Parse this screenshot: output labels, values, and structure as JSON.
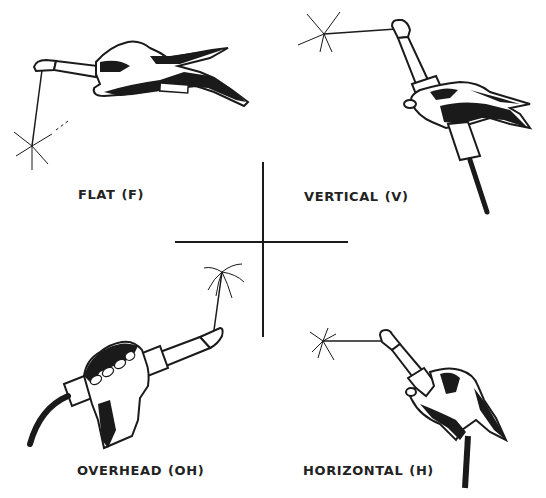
{
  "figure": {
    "positions": [
      {
        "id": "flat",
        "name": "FLAT",
        "code": "(F)"
      },
      {
        "id": "vertical",
        "name": "VERTICAL",
        "code": "(V)"
      },
      {
        "id": "overhead",
        "name": "OVERHEAD",
        "code": "(OH)"
      },
      {
        "id": "horizontal",
        "name": "HORIZONTAL",
        "code": "(H)"
      }
    ]
  },
  "colors": {
    "ink": "#1a1a1a",
    "background": "#ffffff"
  }
}
